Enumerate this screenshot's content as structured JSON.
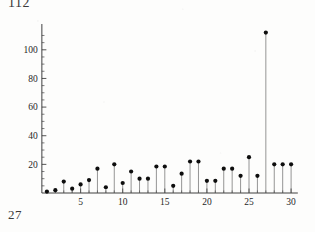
{
  "annotations": {
    "top_left_text": "112",
    "bottom_left_text": "27"
  },
  "chart_data": {
    "type": "scatter",
    "style": "stem-and-dot",
    "title": "",
    "subtitle": "",
    "xlabel": "",
    "ylabel": "",
    "x": [
      1,
      2,
      3,
      4,
      5,
      6,
      7,
      8,
      9,
      10,
      11,
      12,
      13,
      14,
      15,
      16,
      17,
      18,
      19,
      20,
      21,
      22,
      23,
      24,
      25,
      26,
      27,
      28,
      29,
      30
    ],
    "values": [
      1,
      2,
      8,
      3,
      6,
      9,
      17,
      4,
      20,
      7,
      15,
      10,
      10,
      18.5,
      18.5,
      5,
      13.5,
      22,
      22,
      8.5,
      8.5,
      17,
      17,
      12,
      25,
      12,
      112,
      20,
      20,
      20
    ],
    "series": [
      {
        "name": "counts",
        "values": [
          1,
          2,
          8,
          3,
          6,
          9,
          17,
          4,
          20,
          7,
          15,
          10,
          10,
          18.5,
          18.5,
          5,
          13.5,
          22,
          22,
          8.5,
          8.5,
          17,
          17,
          12,
          25,
          12,
          112,
          20,
          20,
          20
        ]
      }
    ],
    "xlim": [
      0,
      31
    ],
    "ylim": [
      0,
      118
    ],
    "x_tick_labels": [
      "5",
      "10",
      "15",
      "20",
      "25",
      "30"
    ],
    "x_tick_values": [
      5,
      10,
      15,
      20,
      25,
      30
    ],
    "x_minor_tick_values": [
      1,
      2,
      3,
      4,
      6,
      7,
      8,
      9,
      11,
      12,
      13,
      14,
      16,
      17,
      18,
      19,
      21,
      22,
      23,
      24,
      26,
      27,
      28,
      29
    ],
    "y_tick_labels": [
      "20",
      "40",
      "60",
      "80",
      "100"
    ],
    "y_tick_values": [
      20,
      40,
      60,
      80,
      100
    ],
    "y_minor_tick_values": [
      5,
      10,
      15,
      25,
      30,
      35,
      45,
      50,
      55,
      65,
      70,
      75,
      85,
      90,
      95,
      105,
      110
    ],
    "grid": false,
    "legend": null,
    "max_value": 112,
    "max_value_x": 27,
    "marker_color": "#0e0e0e",
    "stem_color": "#5d5d5d",
    "axis_color": "#2b2b2b"
  }
}
